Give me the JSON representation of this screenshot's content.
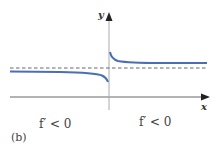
{
  "figure": {
    "caption": "(b)",
    "axes": {
      "x_label": "x",
      "y_label": "y"
    },
    "annotations": [
      {
        "position": "left",
        "text": "f′ < 0"
      },
      {
        "position": "right",
        "text": "f′ < 0"
      }
    ],
    "colors": {
      "curve": "#4a6fb5",
      "axis": "#555555",
      "asymptote": "#444444",
      "text": "#444444"
    },
    "elements": {
      "horizontal_asymptote": "dashed line",
      "vertical_asymptote": "y-axis (x = 0)",
      "left_branch": "decreasing, approaches asymptote from below, dips to -∞ as x→0⁻",
      "right_branch": "decreasing, starts high near x→0⁺, approaches asymptote from above"
    }
  }
}
